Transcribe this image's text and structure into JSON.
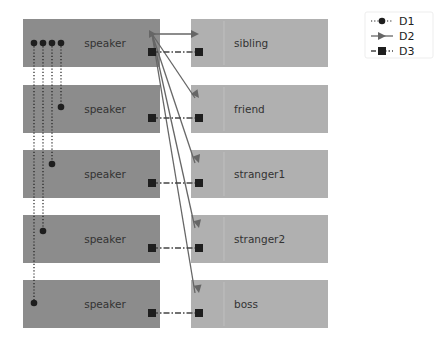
{
  "diagram": {
    "speakers": [
      {
        "label": "speaker"
      },
      {
        "label": "speaker"
      },
      {
        "label": "speaker"
      },
      {
        "label": "speaker"
      },
      {
        "label": "speaker"
      }
    ],
    "listeners": [
      {
        "label": "sibling"
      },
      {
        "label": "friend"
      },
      {
        "label": "stranger1"
      },
      {
        "label": "stranger2"
      },
      {
        "label": "boss"
      }
    ],
    "legend": [
      {
        "name": "D1",
        "marker": "circle",
        "line": "dotted"
      },
      {
        "name": "D2",
        "marker": "triangle",
        "line": "solid"
      },
      {
        "name": "D3",
        "marker": "square",
        "line": "dashdot"
      }
    ],
    "colors": {
      "speaker_box": "#8c8c8c",
      "listener_box": "#b0b0b0",
      "marker": "#1e1e1e",
      "arrow": "#666666"
    }
  }
}
